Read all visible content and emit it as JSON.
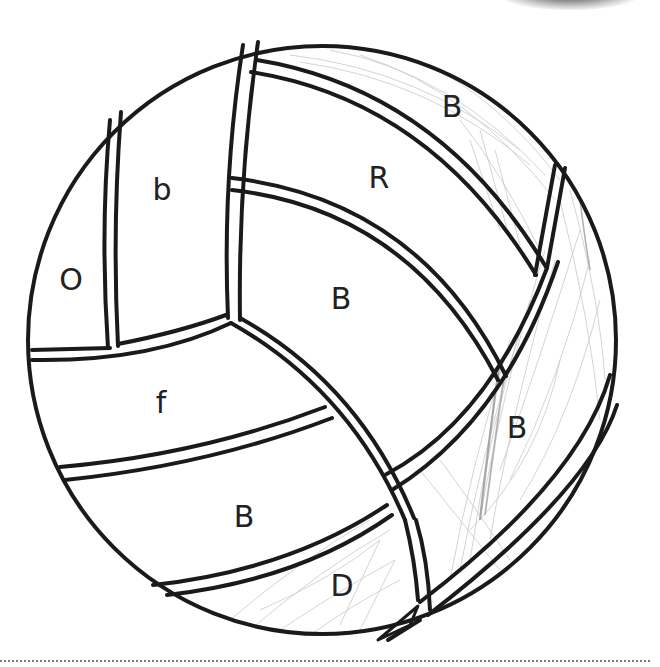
{
  "worksheet": {
    "type": "color-by-letter",
    "subject": "volleyball",
    "labels": {
      "panel_far_left": "O",
      "panel_left_upper": "b",
      "panel_top_band": "B",
      "panel_top_right": "R",
      "panel_center": "B",
      "panel_left_middle": "f",
      "panel_right_band": "B",
      "panel_left_lower": "B",
      "panel_bottom": "D"
    },
    "colors": {
      "outline": "#1a1a1a",
      "label_text": "#222222",
      "pencil_shading": "#b8b8b8",
      "background": "#ffffff",
      "cut_line": "#777777"
    },
    "shaded_panels": [
      "panel_top_band",
      "panel_right_band",
      "panel_bottom"
    ]
  }
}
